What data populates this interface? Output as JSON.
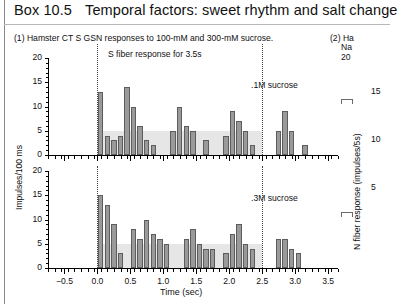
{
  "box": {
    "number": "Box 10.5",
    "title": "Temporal factors: sweet rhythm and salt change"
  },
  "panel1": {
    "caption": "(1) Hamster CT S GSN responses to 100-mM and 300-mM sucrose.",
    "annotation_top": "S fiber response for 3.5s",
    "annotation_a": ".1M sucrose",
    "annotation_b": ".3M sucrose"
  },
  "panel2": {
    "caption_line1": "(2) Ha",
    "caption_line2": "Na",
    "caption_line3": "20"
  },
  "axes": {
    "ylabel_left": "Impulses/100 ms",
    "ylabel_right": "N fiber response (impulses/5s)",
    "xlabel": "Time (sec)",
    "yticks_left": [
      "0",
      "5",
      "10",
      "15",
      "20"
    ],
    "yticks_right": [
      "5",
      "10",
      "15"
    ],
    "xticks": [
      "−0.5",
      "0.0",
      "0.5",
      "1.0",
      "1.5",
      "2.0",
      "2.5",
      "3.0",
      "3.5"
    ]
  },
  "colors": {
    "bar_fill": "#9a9a9a",
    "bar_edge": "#5d5d5d",
    "band": "#e6e6e6",
    "axis": "#000000",
    "dotted_line": "#444444"
  },
  "chart_data": [
    {
      "type": "bar",
      "title": "S fiber response for 3.5s — .1M sucrose",
      "xlabel": "Time (sec)",
      "ylabel": "Impulses/100 ms",
      "xlim": [
        -0.75,
        3.65
      ],
      "ylim": [
        0,
        20
      ],
      "yticks": [
        0,
        5,
        10,
        15,
        20
      ],
      "xticks": [
        -0.5,
        0.0,
        0.5,
        1.0,
        1.5,
        2.0,
        2.5,
        3.0,
        3.5
      ],
      "grid": false,
      "legend": "none",
      "shaded_band": {
        "x0": 0.0,
        "x1": 2.5,
        "y0": 0,
        "y1": 5
      },
      "vlines": [
        0.0,
        2.5
      ],
      "bin_width": 0.1,
      "x": [
        0.0,
        0.1,
        0.2,
        0.3,
        0.4,
        0.5,
        0.6,
        0.7,
        0.8,
        0.9,
        1.0,
        1.1,
        1.2,
        1.3,
        1.4,
        1.5,
        1.6,
        1.7,
        1.8,
        1.9,
        2.0,
        2.1,
        2.2,
        2.3,
        2.4,
        2.5,
        2.6,
        2.7,
        2.8,
        2.9,
        3.0,
        3.1,
        3.2,
        3.3
      ],
      "values": [
        13,
        4,
        3,
        4,
        14,
        10,
        6,
        3,
        2,
        0,
        0,
        5,
        10,
        6,
        5,
        0,
        3,
        0,
        0,
        4,
        9,
        7,
        5,
        2,
        0,
        0,
        0,
        5,
        9,
        5,
        0,
        2,
        0,
        0
      ]
    },
    {
      "type": "bar",
      "title": ".3M sucrose",
      "xlabel": "Time (sec)",
      "ylabel": "Impulses/100 ms",
      "xlim": [
        -0.75,
        3.65
      ],
      "ylim": [
        0,
        20
      ],
      "yticks": [
        0,
        5,
        10,
        15,
        20
      ],
      "xticks": [
        -0.5,
        0.0,
        0.5,
        1.0,
        1.5,
        2.0,
        2.5,
        3.0,
        3.5
      ],
      "grid": false,
      "legend": "none",
      "shaded_band": {
        "x0": 0.0,
        "x1": 2.5,
        "y0": 0,
        "y1": 5
      },
      "vlines": [
        0.0,
        2.5
      ],
      "bin_width": 0.1,
      "x": [
        0.0,
        0.1,
        0.2,
        0.3,
        0.4,
        0.5,
        0.6,
        0.7,
        0.8,
        0.9,
        1.0,
        1.1,
        1.2,
        1.3,
        1.4,
        1.5,
        1.6,
        1.7,
        1.8,
        1.9,
        2.0,
        2.1,
        2.2,
        2.3,
        2.4,
        2.5,
        2.6,
        2.7,
        2.8,
        2.9,
        3.0,
        3.1,
        3.2,
        3.3
      ],
      "values": [
        15,
        13,
        9,
        3,
        0,
        8,
        6,
        10,
        7,
        6,
        5,
        0,
        0,
        6,
        8,
        5,
        4,
        4,
        0,
        3,
        7,
        9,
        5,
        4,
        0,
        0,
        0,
        6,
        6,
        4,
        3,
        0,
        0,
        0
      ]
    }
  ]
}
